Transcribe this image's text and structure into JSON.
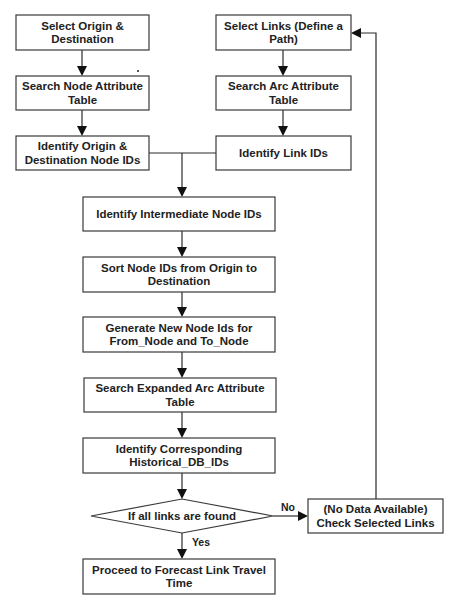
{
  "diagram": {
    "type": "flowchart",
    "nodes": [
      {
        "id": "select_od",
        "shape": "rect",
        "lines": [
          "Select Origin &",
          "Destination"
        ]
      },
      {
        "id": "search_node_attr",
        "shape": "rect",
        "lines": [
          "Search Node Attribute",
          "Table"
        ]
      },
      {
        "id": "identify_od_nodes",
        "shape": "rect",
        "lines": [
          "Identify Origin &",
          "Destination Node IDs"
        ]
      },
      {
        "id": "select_links",
        "shape": "rect",
        "lines": [
          "Select Links (Define a",
          "Path)"
        ]
      },
      {
        "id": "search_arc_attr",
        "shape": "rect",
        "lines": [
          "Search Arc Attribute",
          "Table"
        ]
      },
      {
        "id": "identify_link_ids",
        "shape": "rect",
        "lines": [
          "Identify Link IDs"
        ]
      },
      {
        "id": "identify_intermediate",
        "shape": "rect",
        "lines": [
          "Identify Intermediate Node IDs"
        ]
      },
      {
        "id": "sort_node_ids",
        "shape": "rect",
        "lines": [
          "Sort Node IDs from Origin to",
          "Destination"
        ]
      },
      {
        "id": "generate_new_ids",
        "shape": "rect",
        "lines": [
          "Generate New Node Ids for",
          "From_Node and To_Node"
        ]
      },
      {
        "id": "search_expanded_arc",
        "shape": "rect",
        "lines": [
          "Search Expanded Arc Attribute",
          "Table"
        ]
      },
      {
        "id": "identify_historical",
        "shape": "rect",
        "lines": [
          "Identify Corresponding",
          "Historical_DB_IDs"
        ]
      },
      {
        "id": "decision_all_found",
        "shape": "diamond",
        "lines": [
          "If all links are found"
        ]
      },
      {
        "id": "check_selected",
        "shape": "rect",
        "lines": [
          "(No Data Available)",
          "Check Selected Links"
        ]
      },
      {
        "id": "proceed_forecast",
        "shape": "rect",
        "lines": [
          "Proceed to Forecast Link Travel",
          "Time"
        ]
      }
    ],
    "edges": [
      {
        "from": "select_od",
        "to": "search_node_attr",
        "label": ""
      },
      {
        "from": "search_node_attr",
        "to": "identify_od_nodes",
        "label": ""
      },
      {
        "from": "select_links",
        "to": "search_arc_attr",
        "label": ""
      },
      {
        "from": "search_arc_attr",
        "to": "identify_link_ids",
        "label": ""
      },
      {
        "from": "identify_od_nodes",
        "to": "identify_intermediate",
        "label": ""
      },
      {
        "from": "identify_link_ids",
        "to": "identify_intermediate",
        "label": ""
      },
      {
        "from": "identify_intermediate",
        "to": "sort_node_ids",
        "label": ""
      },
      {
        "from": "sort_node_ids",
        "to": "generate_new_ids",
        "label": ""
      },
      {
        "from": "generate_new_ids",
        "to": "search_expanded_arc",
        "label": ""
      },
      {
        "from": "search_expanded_arc",
        "to": "identify_historical",
        "label": ""
      },
      {
        "from": "identify_historical",
        "to": "decision_all_found",
        "label": ""
      },
      {
        "from": "decision_all_found",
        "to": "check_selected",
        "label": "No"
      },
      {
        "from": "decision_all_found",
        "to": "proceed_forecast",
        "label": "Yes"
      },
      {
        "from": "check_selected",
        "to": "select_links",
        "label": ""
      }
    ]
  }
}
